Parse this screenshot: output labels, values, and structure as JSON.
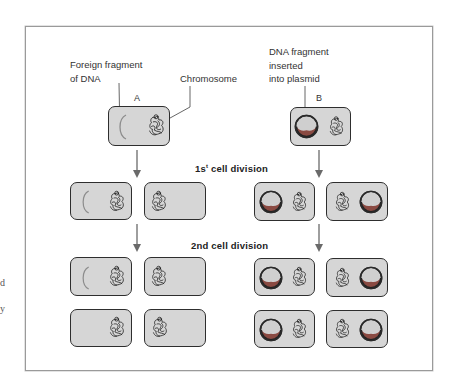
{
  "figure": {
    "labels": {
      "foreign_fragment": "Foreign fragment\nof DNA",
      "chromosome": "Chromosome",
      "dna_inserted": "DNA fragment\ninserted\ninto plasmid",
      "cell_a": "A",
      "cell_b": "B"
    },
    "divisions": {
      "first_prefix": "1s",
      "first_sup": "t",
      "first_suffix": " cell division",
      "second": "2nd cell division"
    },
    "edge_fragments": [
      "d",
      "y"
    ],
    "colors": {
      "cell_fill": "#d6d6d6",
      "cell_border": "#2e2e2e",
      "plasmid_ring": "#2a2a2a",
      "plasmid_center": "#cfcfcf",
      "plasmid_crescent": "#8a4a42",
      "fragment_arc": "#8c8c8c",
      "arrow": "#6a6a6a",
      "frame": "#9a9a9a"
    },
    "scenarios": [
      {
        "id": "A",
        "description": "Foreign DNA fragment not in plasmid",
        "generations": [
          {
            "cells": [
              {
                "has_fragment": true,
                "has_plasmid": false
              }
            ]
          },
          {
            "cells": [
              {
                "has_fragment": true,
                "has_plasmid": false
              },
              {
                "has_fragment": false,
                "has_plasmid": false
              }
            ]
          },
          {
            "cells": [
              {
                "has_fragment": true,
                "has_plasmid": false
              },
              {
                "has_fragment": false,
                "has_plasmid": false
              },
              {
                "has_fragment": false,
                "has_plasmid": false
              },
              {
                "has_fragment": false,
                "has_plasmid": false
              }
            ]
          }
        ]
      },
      {
        "id": "B",
        "description": "DNA fragment inserted into plasmid",
        "generations": [
          {
            "cells": [
              {
                "has_plasmid": true
              }
            ]
          },
          {
            "cells": [
              {
                "has_plasmid": true
              },
              {
                "has_plasmid": true
              }
            ]
          },
          {
            "cells": [
              {
                "has_plasmid": true
              },
              {
                "has_plasmid": true
              },
              {
                "has_plasmid": true
              },
              {
                "has_plasmid": true
              }
            ]
          }
        ]
      }
    ]
  }
}
